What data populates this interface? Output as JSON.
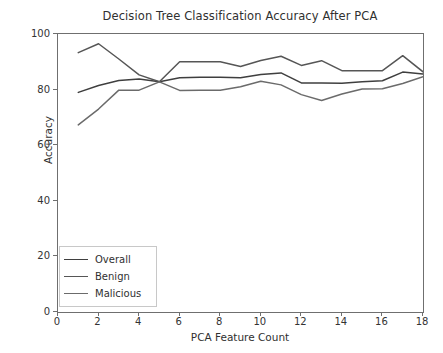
{
  "chart_data": {
    "type": "line",
    "title": "Decision Tree Classification Accuracy After PCA",
    "xlabel": "PCA Feature Count",
    "ylabel": "Accuracy",
    "xlim": [
      0,
      18
    ],
    "ylim": [
      0,
      100
    ],
    "xticks": [
      0,
      2,
      4,
      6,
      8,
      10,
      12,
      14,
      16,
      18
    ],
    "yticks": [
      0,
      20,
      40,
      60,
      80,
      100
    ],
    "grid": false,
    "legend_position": "lower left",
    "x": [
      1,
      2,
      3,
      4,
      5,
      6,
      7,
      8,
      9,
      10,
      11,
      12,
      13,
      14,
      15,
      16,
      17,
      18
    ],
    "series": [
      {
        "name": "Overall",
        "color": "#3f3f3f",
        "values": [
          79.0,
          81.5,
          83.3,
          83.8,
          82.8,
          84.3,
          84.4,
          84.4,
          84.3,
          85.4,
          86.0,
          82.4,
          82.4,
          82.3,
          82.8,
          83.2,
          86.3,
          85.6
        ]
      },
      {
        "name": "Benign",
        "color": "#565656",
        "values": [
          93.3,
          96.5,
          91.0,
          85.3,
          82.8,
          90.0,
          90.0,
          90.0,
          88.3,
          90.5,
          92.0,
          88.7,
          90.4,
          86.8,
          86.8,
          86.8,
          92.2,
          86.4
        ]
      },
      {
        "name": "Malicious",
        "color": "#6b6b6b",
        "values": [
          67.3,
          73.0,
          79.8,
          79.8,
          82.8,
          79.7,
          79.8,
          79.8,
          81.0,
          83.0,
          81.7,
          78.2,
          76.1,
          78.4,
          80.2,
          80.3,
          82.2,
          84.6
        ]
      }
    ]
  },
  "figure": {
    "background": "#ffffff",
    "axis_color": "#6f6f6f",
    "text_color": "#303030"
  }
}
